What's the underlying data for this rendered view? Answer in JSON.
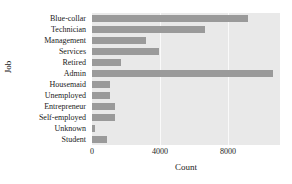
{
  "chart_data": {
    "type": "bar",
    "orientation": "horizontal",
    "title": "",
    "xlabel": "Count",
    "ylabel": "Job",
    "categories": [
      "Blue-collar",
      "Technician",
      "Management",
      "Services",
      "Retired",
      "Admin",
      "Housemaid",
      "Unemployed",
      "Entrepreneur",
      "Self-employed",
      "Unknown",
      "Student"
    ],
    "values": [
      9200,
      6650,
      3180,
      3950,
      1700,
      10650,
      1060,
      1060,
      1350,
      1350,
      190,
      880
    ],
    "xticks": [
      0,
      4000,
      8000
    ],
    "xtick_labels": [
      "0",
      "4000",
      "8000"
    ],
    "xlim": [
      0,
      11060
    ],
    "grid": "vertical-only",
    "legend": "none",
    "bar_color": "#9a9a9a",
    "plot_background": "#e9e9e9",
    "figure_background": "#ffffff",
    "gridline_color": "#fafafa"
  }
}
